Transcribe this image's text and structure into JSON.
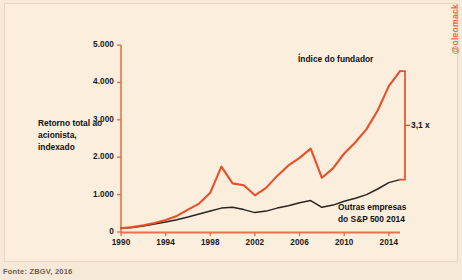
{
  "watermark": "@oleomack",
  "source": "Fonte: ZBGV, 2016",
  "axis_title": "Retorno total ao acionista, indexado",
  "annotations": {
    "founder": "Índice do fundador",
    "others_line1": "Outras empresas",
    "others_line2": "do S&P 500 2014",
    "multiple": "3,1 x"
  },
  "colors": {
    "background": "#f7e9d8",
    "panel": "#fbeedd",
    "founder_line": "#e8502a",
    "others_line": "#2a2320",
    "axis": "#e8734a",
    "text": "#111111"
  },
  "chart_data": {
    "type": "line",
    "title": "",
    "xlabel": "",
    "ylabel": "Retorno total ao acionista, indexado",
    "xlim": [
      1990,
      2015
    ],
    "ylim": [
      0,
      5000
    ],
    "yticks": [
      0,
      1000,
      2000,
      3000,
      4000,
      5000
    ],
    "ytick_labels": [
      "0",
      "1.000",
      "2.000",
      "3.000",
      "4.000",
      "5.000"
    ],
    "xticks": [
      1990,
      1994,
      1998,
      2002,
      2006,
      2010,
      2014
    ],
    "xtick_labels": [
      "1990",
      "1994",
      "1998",
      "2002",
      "2006",
      "2010",
      "2014"
    ],
    "grid": false,
    "legend": "annotations-inline",
    "x": [
      1990,
      1991,
      1992,
      1993,
      1994,
      1995,
      1996,
      1997,
      1998,
      1999,
      2000,
      2001,
      2002,
      2003,
      2004,
      2005,
      2006,
      2007,
      2008,
      2009,
      2010,
      2011,
      2012,
      2013,
      2014,
      2015
    ],
    "series": [
      {
        "name": "Índice do fundador",
        "color": "#e8502a",
        "values": [
          100,
          130,
          180,
          240,
          320,
          430,
          600,
          760,
          1050,
          1750,
          1300,
          1250,
          980,
          1180,
          1500,
          1780,
          1980,
          2230,
          1450,
          1700,
          2100,
          2400,
          2750,
          3250,
          3900,
          4300
        ]
      },
      {
        "name": "Outras empresas do S&P 500 2014",
        "color": "#2a2320",
        "values": [
          100,
          120,
          160,
          210,
          270,
          330,
          400,
          480,
          560,
          640,
          660,
          600,
          520,
          560,
          640,
          700,
          780,
          840,
          660,
          720,
          820,
          900,
          1000,
          1150,
          1320,
          1400
        ]
      }
    ],
    "callout": {
      "label": "3,1 x",
      "top_value": 4300,
      "bottom_value": 1400
    }
  }
}
